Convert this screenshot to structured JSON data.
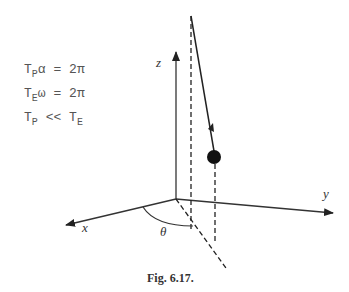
{
  "equations": [
    {
      "lhs_sym": "T",
      "lhs_sub": "P",
      "lhs_var": "α",
      "op": "=",
      "rhs": "2π"
    },
    {
      "lhs_sym": "T",
      "lhs_sub": "E",
      "lhs_var": "ω",
      "op": "=",
      "rhs": "2π"
    },
    {
      "lhs_sym": "T",
      "lhs_sub": "P",
      "lhs_var": "",
      "op": "<<",
      "rhs_sym": "T",
      "rhs_sub": "E"
    }
  ],
  "axes": {
    "z": "z",
    "y": "y",
    "x": "x"
  },
  "angle_label": "θ",
  "caption": "Fig. 6.17."
}
